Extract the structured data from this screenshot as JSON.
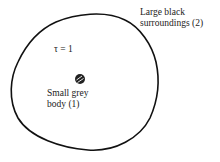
{
  "diagram": {
    "surroundings_label_line1": "Large black",
    "surroundings_label_line2": "surroundings (2)",
    "transmissivity_label": "τ = 1",
    "body_label_line1": "Small grey",
    "body_label_line2": "body (1)"
  }
}
